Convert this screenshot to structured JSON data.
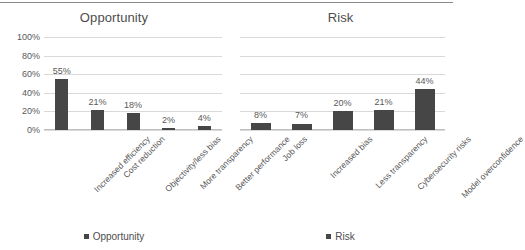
{
  "chart_data": [
    {
      "type": "bar",
      "title": "Opportunity",
      "xlabel": "",
      "ylabel": "",
      "ylim": [
        0,
        100
      ],
      "yticks": [
        "0%",
        "20%",
        "40%",
        "60%",
        "80%",
        "100%"
      ],
      "grid": true,
      "legend": "Opportunity",
      "legend_position": "bottom",
      "series_color": "#464646",
      "categories": [
        "Increased efficiency",
        "Cost reduction",
        "Objectivity/less bias",
        "More transparency",
        "Better performance"
      ],
      "values": [
        55,
        21,
        18,
        2,
        4
      ],
      "labels": [
        "55%",
        "21%",
        "18%",
        "2%",
        "4%"
      ]
    },
    {
      "type": "bar",
      "title": "Risk",
      "xlabel": "",
      "ylabel": "",
      "ylim": [
        0,
        100
      ],
      "yticks": [],
      "grid": true,
      "legend": "Risk",
      "legend_position": "bottom",
      "series_color": "#464646",
      "categories": [
        "Job loss",
        "Increased bias",
        "Less transparency",
        "Cybersecurity risks",
        "Model overconfidence"
      ],
      "values": [
        8,
        7,
        20,
        21,
        44
      ],
      "labels": [
        "8%",
        "7%",
        "20%",
        "21%",
        "44%"
      ]
    }
  ]
}
